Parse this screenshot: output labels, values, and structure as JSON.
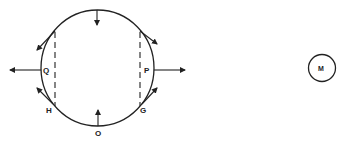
{
  "diagram": {
    "labels": {
      "Q": "Q",
      "P": "P",
      "H": "H",
      "G": "G",
      "O": "O",
      "M": "M"
    },
    "colors": {
      "stroke": "#222222",
      "background": "#ffffff"
    }
  }
}
